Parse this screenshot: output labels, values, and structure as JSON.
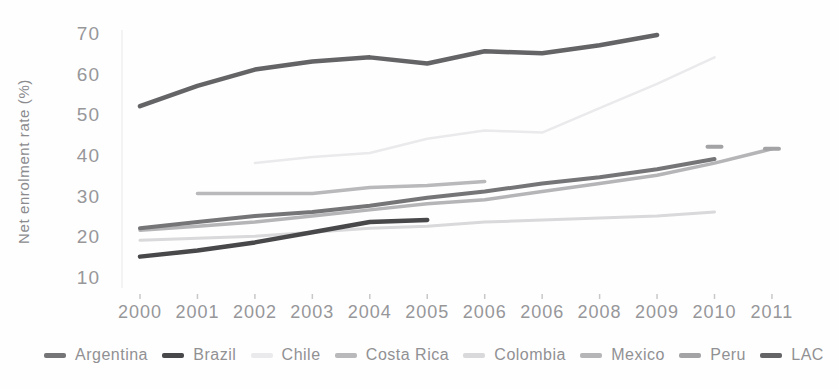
{
  "figure": {
    "ylabel": "Net enrolment rate (%)"
  },
  "chart_data": {
    "type": "line",
    "title": "",
    "xlabel": "",
    "ylabel": "Net enrolment rate (%)",
    "x_labels": [
      "2000",
      "2001",
      "2002",
      "2003",
      "2004",
      "2005",
      "2006",
      "2006",
      "2008",
      "2009",
      "2010",
      "2011"
    ],
    "y_ticks": [
      10,
      20,
      30,
      40,
      50,
      60,
      70
    ],
    "ylim": [
      10,
      70
    ],
    "grid": false,
    "legend_position": "bottom",
    "axis_text_color": "#97979a",
    "series": [
      {
        "name": "Argentina",
        "color": "#757578",
        "width": 4,
        "z": 6,
        "style": "line",
        "values": [
          22.5,
          24,
          25.5,
          26.5,
          28,
          30,
          31.5,
          33.5,
          35,
          37,
          39.5,
          null
        ]
      },
      {
        "name": "Brazil",
        "color": "#48484b",
        "width": 4.5,
        "z": 7,
        "style": "line",
        "values": [
          15.5,
          17,
          19,
          21.5,
          24,
          24.5,
          null,
          null,
          null,
          null,
          null,
          null
        ]
      },
      {
        "name": "Chile",
        "color": "#eaeaec",
        "width": 2.5,
        "z": 1,
        "style": "line",
        "values": [
          null,
          null,
          38.5,
          40,
          41,
          44.5,
          46.5,
          46,
          52,
          58,
          64.5,
          null
        ]
      },
      {
        "name": "Costa Rica",
        "color": "#b9b9bc",
        "width": 3.5,
        "z": 3,
        "style": "line",
        "values": [
          null,
          31,
          31,
          31,
          32.5,
          33,
          34,
          null,
          null,
          null,
          null,
          null
        ]
      },
      {
        "name": "Colombia",
        "color": "#d9d9db",
        "width": 3,
        "z": 2,
        "style": "line",
        "values": [
          19.5,
          20,
          20.5,
          21.5,
          22.5,
          23,
          24,
          24.5,
          25,
          25.5,
          26.5,
          null
        ]
      },
      {
        "name": "Mexico",
        "color": "#b5b5b8",
        "width": 3.5,
        "z": 4,
        "style": "line",
        "values": [
          22,
          23,
          24,
          25.5,
          27,
          28.5,
          29.5,
          31.5,
          33.5,
          35.5,
          38.5,
          42
        ]
      },
      {
        "name": "Peru",
        "color": "#a3a3a6",
        "width": 4,
        "z": 5,
        "style": "dashes",
        "values": [
          null,
          null,
          null,
          null,
          null,
          null,
          null,
          null,
          null,
          null,
          42.5,
          42
        ]
      },
      {
        "name": "LAC",
        "color": "#646467",
        "width": 4.5,
        "z": 8,
        "style": "line",
        "values": [
          52.5,
          57.5,
          61.5,
          63.5,
          64.5,
          63,
          66,
          65.5,
          67.5,
          70,
          null,
          null
        ]
      }
    ]
  }
}
